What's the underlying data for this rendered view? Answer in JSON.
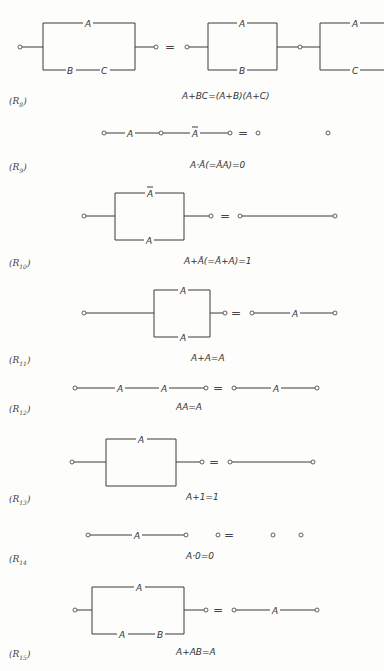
{
  "rules": [
    {
      "id": "R8",
      "label": "(R",
      "sub": "8",
      "close": ")",
      "formula": "A+BC=(A+B)(A+C)",
      "left_diagram": {
        "type": "parallel",
        "top": [
          "A"
        ],
        "bottom": [
          "B",
          "C"
        ]
      },
      "right_diagram": {
        "type": "series_of_parallels",
        "blocks": [
          {
            "top": [
              "A"
            ],
            "bottom": [
              "B"
            ]
          },
          {
            "top": [
              "A"
            ],
            "bottom": [
              "C"
            ]
          }
        ]
      }
    },
    {
      "id": "R9",
      "label": "(R",
      "sub": "9",
      "close": ")",
      "formula": "A·Ā(=ĀA)=0",
      "left_diagram": {
        "type": "series",
        "contacts": [
          "A",
          "Ā"
        ]
      },
      "right_diagram": {
        "type": "open"
      }
    },
    {
      "id": "R10",
      "label": "(R",
      "sub": "10",
      "close": ")",
      "formula": "A+Ā(=Ā+A)=1",
      "left_diagram": {
        "type": "parallel",
        "top": [
          "Ā"
        ],
        "bottom": [
          "A"
        ]
      },
      "right_diagram": {
        "type": "closed"
      }
    },
    {
      "id": "R11",
      "label": "(R",
      "sub": "11",
      "close": ")",
      "formula": "A+A=A",
      "left_diagram": {
        "type": "parallel",
        "top": [
          "A"
        ],
        "bottom": [
          "A"
        ]
      },
      "right_diagram": {
        "type": "series",
        "contacts": [
          "A"
        ]
      }
    },
    {
      "id": "R12",
      "label": "(R",
      "sub": "12",
      "close": ")",
      "formula": "AA=A",
      "left_diagram": {
        "type": "series",
        "contacts": [
          "A",
          "A"
        ]
      },
      "right_diagram": {
        "type": "series",
        "contacts": [
          "A"
        ]
      }
    },
    {
      "id": "R13",
      "label": "(R",
      "sub": "13",
      "close": ")",
      "formula": "A+1=1",
      "left_diagram": {
        "type": "parallel",
        "top": [
          "A"
        ],
        "bottom": []
      },
      "right_diagram": {
        "type": "closed"
      }
    },
    {
      "id": "R14",
      "label": "(R",
      "sub": "14",
      "close": "",
      "formula": "A·0=0",
      "left_diagram": {
        "type": "series_open",
        "contacts": [
          "A"
        ]
      },
      "right_diagram": {
        "type": "open"
      }
    },
    {
      "id": "R15",
      "label": "(R",
      "sub": "15",
      "close": ")",
      "formula": "A+AB=A",
      "left_diagram": {
        "type": "parallel",
        "top": [
          "A"
        ],
        "bottom": [
          "A",
          "B"
        ]
      },
      "right_diagram": {
        "type": "series",
        "contacts": [
          "A"
        ]
      }
    }
  ],
  "symbols": {
    "equals": "=",
    "A": "A",
    "A_bar": "A",
    "B": "B",
    "C": "C"
  }
}
